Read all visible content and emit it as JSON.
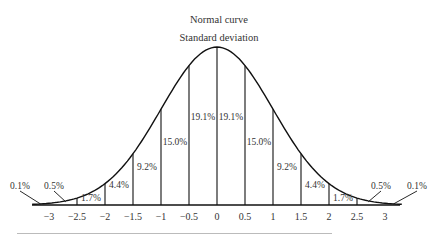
{
  "chart_data": {
    "type": "area",
    "title": "Normal curve",
    "subtitle": "Standard deviation",
    "xlabel": "",
    "ylabel": "",
    "xlim": [
      -3.3,
      3.3
    ],
    "grid": false,
    "legend": null,
    "x_ticks": [
      "-3",
      "-2.5",
      "-2",
      "-1.5",
      "-1",
      "-0.5",
      "0",
      "0.5",
      "1",
      "1.5",
      "2",
      "2.5",
      "3"
    ],
    "segments": [
      {
        "from": -3.5,
        "to": -3.0,
        "percent": "0.1%"
      },
      {
        "from": -3.0,
        "to": -2.5,
        "percent": "0.5%"
      },
      {
        "from": -2.5,
        "to": -2.0,
        "percent": "1.7%"
      },
      {
        "from": -2.0,
        "to": -1.5,
        "percent": "4.4%"
      },
      {
        "from": -1.5,
        "to": -1.0,
        "percent": "9.2%"
      },
      {
        "from": -1.0,
        "to": -0.5,
        "percent": "15.0%"
      },
      {
        "from": -0.5,
        "to": 0.0,
        "percent": "19.1%"
      },
      {
        "from": 0.0,
        "to": 0.5,
        "percent": "19.1%"
      },
      {
        "from": 0.5,
        "to": 1.0,
        "percent": "15.0%"
      },
      {
        "from": 1.0,
        "to": 1.5,
        "percent": "9.2%"
      },
      {
        "from": 1.5,
        "to": 2.0,
        "percent": "4.4%"
      },
      {
        "from": 2.0,
        "to": 2.5,
        "percent": "1.7%"
      },
      {
        "from": 2.5,
        "to": 3.0,
        "percent": "0.5%"
      },
      {
        "from": 3.0,
        "to": 3.5,
        "percent": "0.1%"
      }
    ]
  }
}
